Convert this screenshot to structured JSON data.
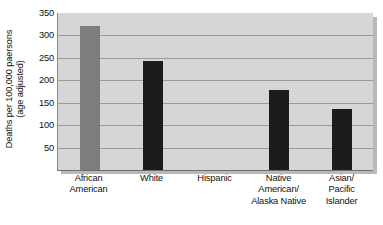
{
  "chart_data": {
    "type": "bar",
    "title": "",
    "subtitle": "",
    "xlabel": "",
    "ylabel_lines": [
      "Deaths per 100,000 paersons",
      "(age adjusted)"
    ],
    "ylabel": "Deaths per 100,000 paersons (age adjusted)",
    "categories": [
      "African American",
      "White",
      "Hispanic",
      "Native American/ Alaska Native",
      "Asian/ Pacific Islander"
    ],
    "category_lines": [
      [
        "African",
        "American"
      ],
      [
        "White"
      ],
      [
        "Hispanic"
      ],
      [
        "Native",
        "American/",
        "Alaska Native"
      ],
      [
        "Asian/",
        "Pacific",
        "Islander"
      ]
    ],
    "values": [
      322,
      243,
      0,
      178,
      137
    ],
    "value_labels": [
      "322",
      "243",
      "",
      "178",
      "137"
    ],
    "bar_colors": [
      "#7d7d7d",
      "#1c1c1c",
      "#d6d6d6",
      "#1c1c1c",
      "#1c1c1c"
    ],
    "ylim": [
      0,
      350
    ],
    "yticks": [
      350,
      300,
      250,
      200,
      150,
      100,
      50
    ],
    "ytick_labels": [
      "350",
      "300",
      "250",
      "200",
      "150",
      "100",
      "50"
    ],
    "grid": true,
    "legend": "none",
    "plot_background": "#d6d6d6",
    "gridline_color": "#9a9a9a",
    "axis_color": "#6e6e6e",
    "text_color": "#111111"
  }
}
